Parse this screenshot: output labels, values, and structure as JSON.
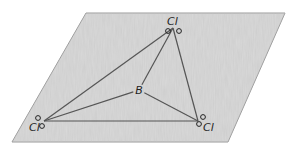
{
  "diagram": {
    "colors": {
      "plane_fill": "#d9d9d9",
      "plane_edge": "#9a9a9a",
      "bond": "#555555",
      "text": "#222222"
    },
    "plane": {
      "points": "86,13 285,13 228,142 12,142"
    },
    "central_atom": {
      "label": "B",
      "x": 139,
      "y": 90
    },
    "ligands": [
      {
        "id": "cl-top",
        "label": "Cl",
        "x": 173,
        "y": 28,
        "lx": 167,
        "ly": 25,
        "lone_pairs": [
          [
            168,
            31
          ],
          [
            179,
            31
          ]
        ]
      },
      {
        "id": "cl-left",
        "label": "Cl",
        "x": 44,
        "y": 121,
        "lx": 29,
        "ly": 131,
        "lone_pairs": [
          [
            38,
            118
          ],
          [
            42,
            126
          ]
        ]
      },
      {
        "id": "cl-right",
        "label": "Cl",
        "x": 198,
        "y": 121,
        "lx": 203,
        "ly": 131,
        "lone_pairs": [
          [
            203,
            117
          ],
          [
            199,
            124
          ]
        ]
      }
    ],
    "bonds": [
      {
        "from": "B",
        "to": "cl-top"
      },
      {
        "from": "B",
        "to": "cl-left"
      },
      {
        "from": "B",
        "to": "cl-right"
      }
    ],
    "triangle_edges": [
      [
        "cl-top",
        "cl-left"
      ],
      [
        "cl-top",
        "cl-right"
      ],
      [
        "cl-left",
        "cl-right"
      ]
    ]
  }
}
